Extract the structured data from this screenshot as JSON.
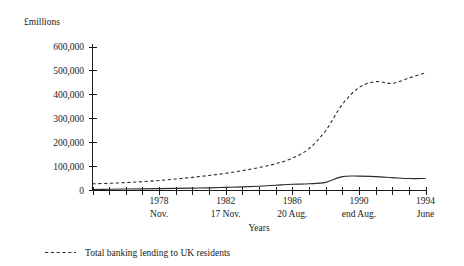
{
  "chart_data": {
    "type": "line",
    "title": "",
    "subtitle": "",
    "xlabel": "Years",
    "ylabel": "",
    "unit_label": "£millions",
    "ylim": [
      0,
      600000
    ],
    "yticks": [
      0,
      100000,
      200000,
      300000,
      400000,
      500000,
      600000
    ],
    "ytick_labels": [
      "0",
      "100,000",
      "200,000",
      "300,000",
      "400,000",
      "500,000",
      "600,000"
    ],
    "grid": false,
    "legend_position": "bottom-left",
    "x_axis": {
      "tick_count": 21,
      "labelled_ticks": [
        {
          "index": 4,
          "year": "1978",
          "sub": "Nov."
        },
        {
          "index": 8,
          "year": "1982",
          "sub": "17 Nov."
        },
        {
          "index": 12,
          "year": "1986",
          "sub": "20 Aug."
        },
        {
          "index": 16,
          "year": "1990",
          "sub": "end Aug."
        },
        {
          "index": 20,
          "year": "1994",
          "sub": "June"
        }
      ],
      "tick_years": [
        1974,
        1975,
        1976,
        1977,
        1978,
        1979,
        1980,
        1981,
        1982,
        1983,
        1984,
        1985,
        1986,
        1987,
        1988,
        1989,
        1990,
        1991,
        1992,
        1993,
        1994
      ]
    },
    "series": [
      {
        "name": "Total banking lending to UK residents",
        "style": "dashed",
        "in_legend": true,
        "x": [
          1974,
          1975,
          1976,
          1977,
          1978,
          1979,
          1980,
          1981,
          1982,
          1983,
          1984,
          1985,
          1986,
          1987,
          1988,
          1989,
          1990,
          1991,
          1992,
          1993,
          1994
        ],
        "values": [
          28000,
          30000,
          33000,
          37000,
          42000,
          48000,
          55000,
          63000,
          72000,
          83000,
          96000,
          112000,
          135000,
          175000,
          250000,
          360000,
          430000,
          455000,
          448000,
          470000,
          492000
        ]
      },
      {
        "name": "",
        "style": "solid",
        "in_legend": false,
        "x": [
          1974,
          1975,
          1976,
          1977,
          1978,
          1979,
          1980,
          1981,
          1982,
          1983,
          1984,
          1985,
          1986,
          1987,
          1988,
          1989,
          1990,
          1991,
          1992,
          1993,
          1994
        ],
        "values": [
          4000,
          5000,
          6000,
          7000,
          8000,
          9000,
          10000,
          11000,
          13000,
          15000,
          18000,
          22000,
          26000,
          28000,
          34000,
          58000,
          60000,
          58000,
          54000,
          50000,
          50000
        ]
      }
    ],
    "legend": [
      {
        "label": "Total banking lending to UK residents",
        "style": "dashed"
      }
    ]
  }
}
